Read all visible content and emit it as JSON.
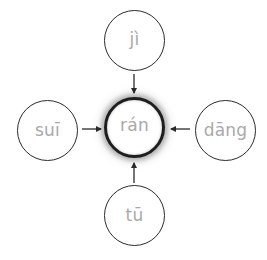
{
  "diagram": {
    "center": {
      "label": "rán",
      "x": 134,
      "y": 127,
      "r": 30
    },
    "nodes": [
      {
        "id": "top",
        "label": "jì",
        "x": 134,
        "y": 40,
        "r": 30
      },
      {
        "id": "left",
        "label": "suī",
        "x": 47,
        "y": 130,
        "r": 30
      },
      {
        "id": "right",
        "label": "dāng",
        "x": 225,
        "y": 130,
        "r": 30
      },
      {
        "id": "bottom",
        "label": "tū",
        "x": 134,
        "y": 216,
        "r": 30
      }
    ],
    "arrows": [
      {
        "from": "top",
        "to": "center",
        "x1": 134,
        "y1": 74,
        "x2": 134,
        "y2": 93
      },
      {
        "from": "left",
        "to": "center",
        "x1": 82,
        "y1": 129,
        "x2": 101,
        "y2": 129
      },
      {
        "from": "right",
        "to": "center",
        "x1": 190,
        "y1": 129,
        "x2": 171,
        "y2": 129
      },
      {
        "from": "bottom",
        "to": "center",
        "x1": 134,
        "y1": 183,
        "x2": 134,
        "y2": 163
      }
    ],
    "colors": {
      "stroke": "#2b2b2b",
      "label": "#a9a9a9",
      "background": "#ffffff"
    }
  }
}
